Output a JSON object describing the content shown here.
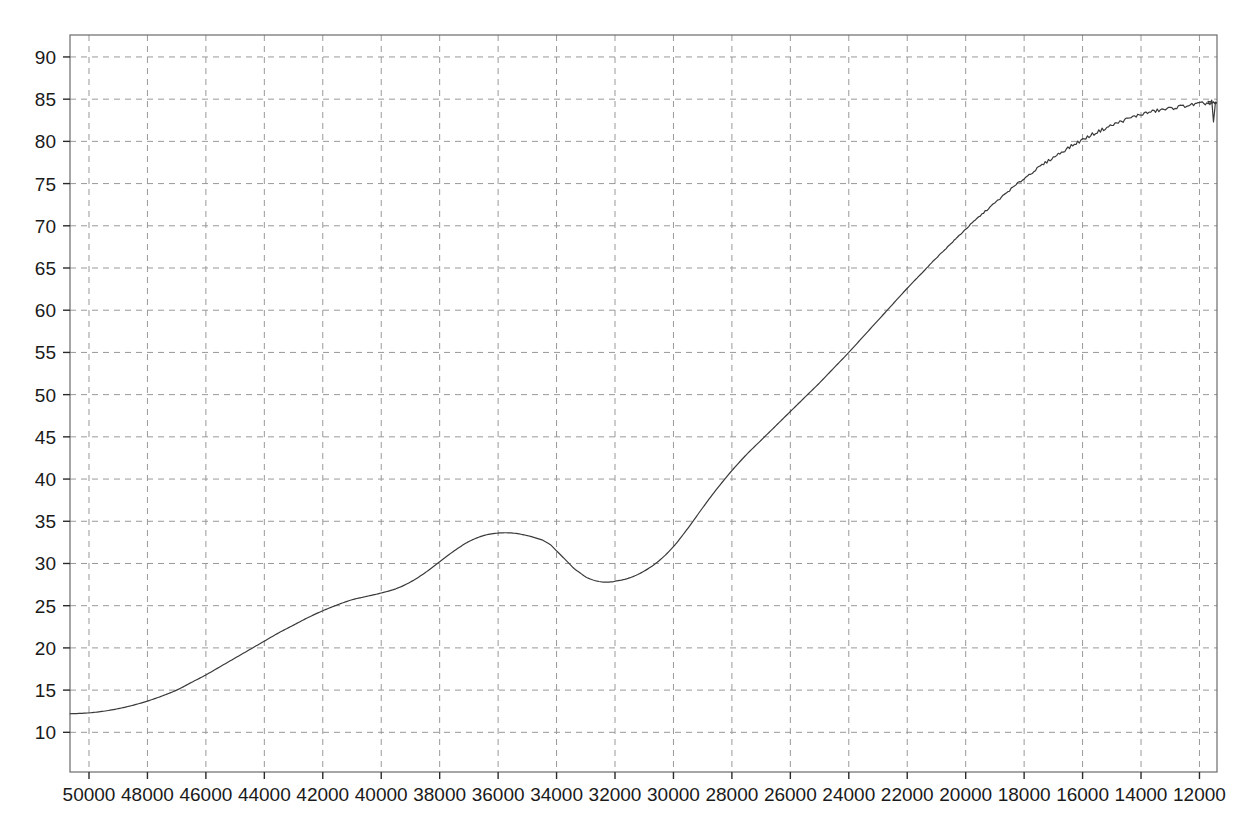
{
  "chart_data": {
    "type": "line",
    "title": "",
    "subtitle": "",
    "xlabel": "",
    "ylabel": "",
    "xlim": [
      50650,
      11400
    ],
    "ylim": [
      5.3,
      92.6
    ],
    "x_reversed": true,
    "grid": true,
    "grid_style": "dashed",
    "grid_color": "#999999",
    "legend": "none",
    "frame_color": "#6b6b6b",
    "line_color": "#3a3a3a",
    "line_width": 1.2,
    "background": "#ffffff",
    "xticks": [
      50000,
      48000,
      46000,
      44000,
      42000,
      40000,
      38000,
      36000,
      34000,
      32000,
      30000,
      28000,
      26000,
      24000,
      22000,
      20000,
      18000,
      16000,
      14000,
      12000
    ],
    "xtick_labels": [
      "50000",
      "48000",
      "46000",
      "44000",
      "42000",
      "40000",
      "38000",
      "36000",
      "34000",
      "32000",
      "30000",
      "28000",
      "26000",
      "24000",
      "22000",
      "20000",
      "18000",
      "16000",
      "14000",
      "12000"
    ],
    "yticks": [
      10,
      15,
      20,
      25,
      30,
      35,
      40,
      45,
      50,
      55,
      60,
      65,
      70,
      75,
      80,
      85,
      90
    ],
    "ytick_labels": [
      "10",
      "15",
      "20",
      "25",
      "30",
      "35",
      "40",
      "45",
      "50",
      "55",
      "60",
      "65",
      "70",
      "75",
      "80",
      "85",
      "90"
    ],
    "series": [
      {
        "name": "spectrum",
        "x": [
          50650,
          50000,
          49500,
          49000,
          48500,
          48000,
          47500,
          47000,
          46500,
          46000,
          45500,
          45000,
          44500,
          44000,
          43500,
          43000,
          42500,
          42000,
          41500,
          41000,
          40500,
          40000,
          39500,
          39000,
          38500,
          38000,
          37500,
          37000,
          36500,
          36000,
          35500,
          35000,
          34500,
          34200,
          34000,
          33800,
          33600,
          33400,
          33200,
          33000,
          32800,
          32600,
          32400,
          32200,
          32000,
          31500,
          31000,
          30500,
          30000,
          29500,
          29000,
          28500,
          28000,
          27500,
          27000,
          26500,
          26000,
          25500,
          25000,
          24500,
          24000,
          23500,
          23000,
          22500,
          22000,
          21500,
          21000,
          20500,
          20000,
          19500,
          19000,
          18500,
          18000,
          17500,
          17000,
          16500,
          16000,
          15500,
          15000,
          14500,
          14000,
          13500,
          13000,
          12500,
          12200,
          12000,
          11800,
          11650,
          11550,
          11480,
          11420
        ],
        "y": [
          12.2,
          12.3,
          12.5,
          12.8,
          13.2,
          13.7,
          14.3,
          15.0,
          15.9,
          16.8,
          17.8,
          18.8,
          19.8,
          20.8,
          21.8,
          22.7,
          23.6,
          24.4,
          25.1,
          25.7,
          26.1,
          26.5,
          27.0,
          27.8,
          28.9,
          30.2,
          31.5,
          32.6,
          33.3,
          33.6,
          33.6,
          33.3,
          32.8,
          32.2,
          31.5,
          30.8,
          30.1,
          29.4,
          28.9,
          28.4,
          28.1,
          27.9,
          27.8,
          27.8,
          27.9,
          28.3,
          29.1,
          30.3,
          32.0,
          34.2,
          36.6,
          38.9,
          41.0,
          42.9,
          44.6,
          46.3,
          48.0,
          49.7,
          51.4,
          53.2,
          55.0,
          56.9,
          58.8,
          60.7,
          62.6,
          64.4,
          66.2,
          67.9,
          69.6,
          71.2,
          72.7,
          74.2,
          75.6,
          76.9,
          78.1,
          79.2,
          80.2,
          81.1,
          81.9,
          82.6,
          83.2,
          83.6,
          83.9,
          84.2,
          84.35,
          84.45,
          84.5,
          84.5,
          84.5,
          84.5,
          84.5
        ]
      }
    ],
    "noise_region": {
      "start_x": 22000,
      "description": "slight high-frequency noise on the plateau"
    },
    "end_notch": {
      "x": 11520,
      "depth": 2.2,
      "description": "sharp narrow downward spike at the extreme right edge"
    },
    "features": {
      "start_value": 12.2,
      "local_max": {
        "x": 38000,
        "y": 33.6
      },
      "local_min": {
        "x": 34000,
        "y": 27.8
      },
      "plateau_value": 84.5,
      "plateau_start_x": 16000,
      "end_value": 84.5
    }
  },
  "plot_geometry": {
    "left": 70,
    "right": 1217,
    "top": 35,
    "bottom": 772
  }
}
